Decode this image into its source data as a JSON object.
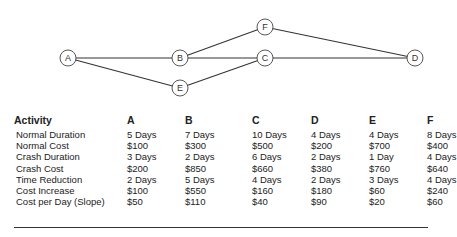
{
  "network": {
    "nodes": [
      {
        "id": "A",
        "x": 68,
        "y": 58
      },
      {
        "id": "B",
        "x": 180,
        "y": 58
      },
      {
        "id": "C",
        "x": 265,
        "y": 58
      },
      {
        "id": "D",
        "x": 415,
        "y": 58
      },
      {
        "id": "E",
        "x": 180,
        "y": 88
      },
      {
        "id": "F",
        "x": 265,
        "y": 27
      }
    ],
    "edges": [
      [
        "A",
        "B"
      ],
      [
        "A",
        "E"
      ],
      [
        "B",
        "C"
      ],
      [
        "B",
        "F"
      ],
      [
        "E",
        "C"
      ],
      [
        "C",
        "D"
      ],
      [
        "F",
        "D"
      ]
    ]
  },
  "table": {
    "headers": [
      "Activity",
      "A",
      "B",
      "C",
      "D",
      "E",
      "F"
    ],
    "rows": [
      [
        "Normal Duration",
        "5 Days",
        "7 Days",
        "10 Days",
        "4 Days",
        "4 Days",
        "8 Days"
      ],
      [
        "Normal Cost",
        "$100",
        "$300",
        "$500",
        "$200",
        "$700",
        "$400"
      ],
      [
        "Crash Duration",
        "3 Days",
        "2 Days",
        "6 Days",
        "2 Days",
        "1 Day",
        "4 Days"
      ],
      [
        "Crash Cost",
        "$200",
        "$850",
        "$660",
        "$380",
        "$760",
        "$640"
      ],
      [
        "Time Reduction",
        "2 Days",
        "5 Days",
        "4 Days",
        "2 Days",
        "3 Days",
        "4 Days"
      ],
      [
        "Cost Increase",
        "$100",
        "$550",
        "$160",
        "$180",
        "$60",
        "$240"
      ],
      [
        "Cost per Day (Slope)",
        "$50",
        "$110",
        "$40",
        "$90",
        "$20",
        "$60"
      ]
    ]
  }
}
